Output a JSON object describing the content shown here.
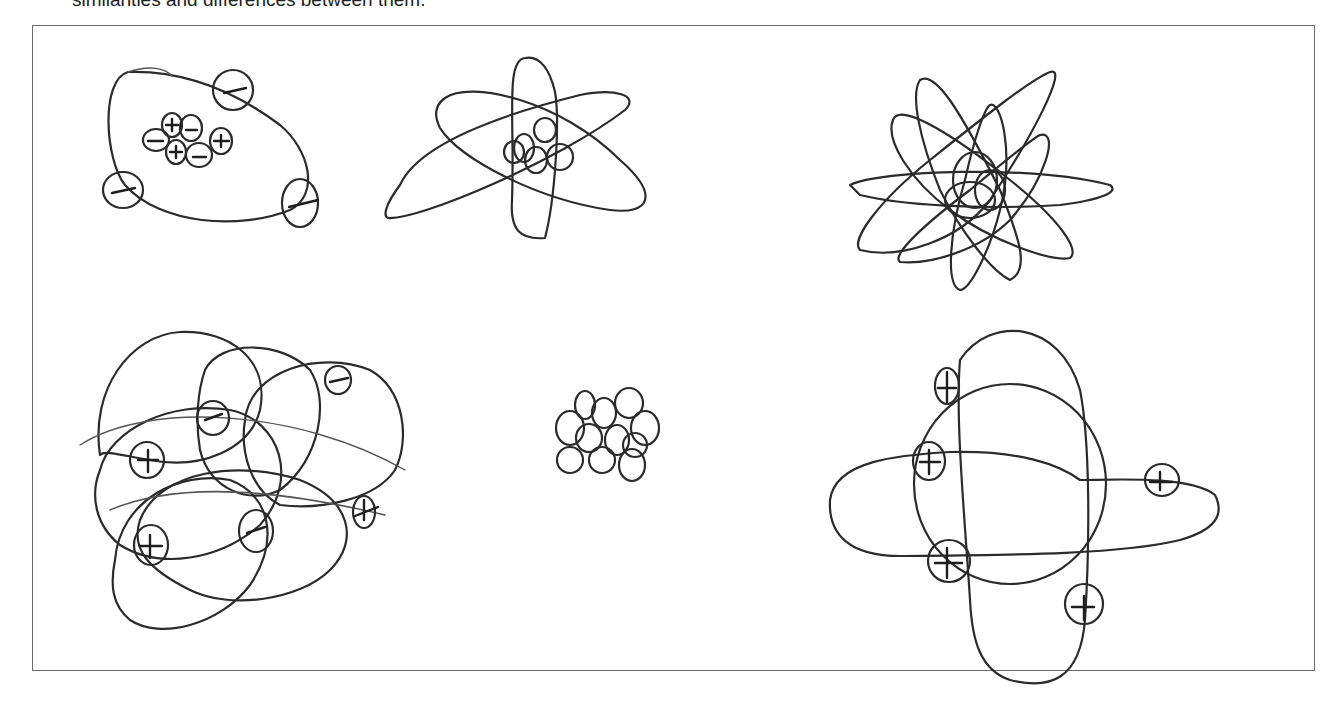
{
  "caption": "similarities and differences between them.",
  "figure": {
    "border_color": "#6b6b6b",
    "ink_color": "#2b2b2b",
    "sketches": [
      {
        "id": "sketch-1",
        "position": "top-left",
        "description": "Large loop with cluster of 7 small circles (with + and - marks) inside and 4 small circles with - marks on the loop"
      },
      {
        "id": "sketch-2",
        "position": "top-middle",
        "description": "Three intersecting elliptical orbits around a small cluster of circles"
      },
      {
        "id": "sketch-3",
        "position": "top-right",
        "description": "Dense tangle of many elliptical orbits around a central cluster"
      },
      {
        "id": "sketch-4",
        "position": "bottom-left",
        "description": "Many overlapping loops with 6 small circles marked + or x"
      },
      {
        "id": "sketch-5",
        "position": "bottom-middle",
        "description": "Cluster of about 12 small circles with no marks"
      },
      {
        "id": "sketch-6",
        "position": "bottom-right",
        "description": "Vertical and horizontal ellipses plus a circle with 6 small marked circles (+ and -)"
      }
    ]
  }
}
